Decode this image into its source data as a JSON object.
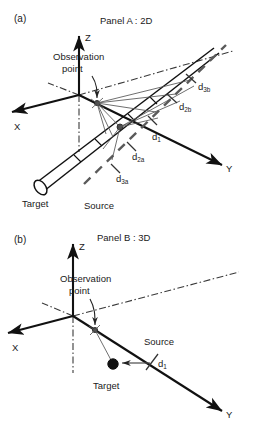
{
  "figure": {
    "background": "#ffffff",
    "ink_color": "#111111",
    "accent_gray": "#555555"
  },
  "panel_a": {
    "tag": "(a)",
    "title": "Panel A : 2D",
    "axes": {
      "z": "Z",
      "x": "X",
      "y": "Y"
    },
    "labels": {
      "observation_line1": "Observation",
      "observation_line2": "point",
      "target": "Target",
      "source": "Source"
    },
    "distances": [
      {
        "id": "d3b",
        "base": "d",
        "sub": "3b"
      },
      {
        "id": "d2b",
        "base": "d",
        "sub": "2b"
      },
      {
        "id": "d1",
        "base": "d",
        "sub": "1"
      },
      {
        "id": "d2a",
        "base": "d",
        "sub": "2a"
      },
      {
        "id": "d3a",
        "base": "d",
        "sub": "3a"
      }
    ]
  },
  "panel_b": {
    "tag": "(b)",
    "title": "Panel B : 3D",
    "axes": {
      "z": "Z",
      "x": "X",
      "y": "Y"
    },
    "labels": {
      "observation_line1": "Observation",
      "observation_line2": "point",
      "target": "Target",
      "source": "Source"
    },
    "distances": [
      {
        "id": "d1",
        "base": "d",
        "sub": "1"
      }
    ]
  }
}
